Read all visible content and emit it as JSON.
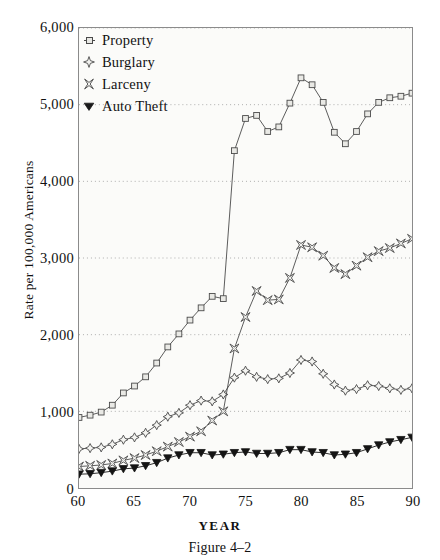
{
  "figure": {
    "caption": "Figure 4–2",
    "xlabel": "YEAR",
    "ylabel": "Rate per 100,000 Americans"
  },
  "axes": {
    "yticks": [
      "0",
      "1,000",
      "2,000",
      "3,000",
      "4,000",
      "5,000",
      "6,000"
    ],
    "xticks": [
      "60",
      "65",
      "70",
      "75",
      "80",
      "85",
      "90"
    ]
  },
  "legend": [
    {
      "label": "Property",
      "marker": "square-marker",
      "color": "#3a3a3a"
    },
    {
      "label": "Burglary",
      "marker": "four-point-star-marker",
      "color": "#3a3a3a"
    },
    {
      "label": "Larceny",
      "marker": "x-star-marker",
      "color": "#3a3a3a"
    },
    {
      "label": "Auto Theft",
      "marker": "filled-triangle-marker",
      "color": "#1a1a1a"
    }
  ],
  "chart_data": {
    "type": "line",
    "title": "",
    "xlabel": "YEAR",
    "ylabel": "Rate per 100,000 Americans",
    "xlim": [
      60,
      90
    ],
    "ylim": [
      0,
      6000
    ],
    "grid": "horizontal-dotted",
    "legend_position": "top-left-inside",
    "x": [
      60,
      61,
      62,
      63,
      64,
      65,
      66,
      67,
      68,
      69,
      70,
      71,
      72,
      73,
      74,
      75,
      76,
      77,
      78,
      79,
      80,
      81,
      82,
      83,
      84,
      85,
      86,
      87,
      88,
      89,
      90
    ],
    "series": [
      {
        "name": "Property",
        "marker": "square",
        "values": [
          920,
          950,
          990,
          1080,
          1240,
          1330,
          1450,
          1630,
          1840,
          2010,
          2190,
          2350,
          2500,
          2470,
          4400,
          4820,
          4860,
          4650,
          4710,
          5020,
          5350,
          5260,
          5030,
          4640,
          4490,
          4650,
          4880,
          5030,
          5090,
          5110,
          5150
        ]
      },
      {
        "name": "Burglary",
        "marker": "four-point-star",
        "values": [
          510,
          520,
          530,
          570,
          630,
          660,
          720,
          820,
          930,
          980,
          1080,
          1140,
          1130,
          1220,
          1440,
          1530,
          1450,
          1420,
          1430,
          1500,
          1670,
          1650,
          1490,
          1350,
          1270,
          1290,
          1340,
          1330,
          1300,
          1280,
          1300
        ]
      },
      {
        "name": "Larceny",
        "marker": "x-star",
        "values": [
          280,
          290,
          300,
          320,
          360,
          390,
          430,
          480,
          540,
          600,
          670,
          740,
          880,
          1000,
          1820,
          2230,
          2570,
          2450,
          2460,
          2740,
          3170,
          3140,
          3030,
          2870,
          2790,
          2900,
          3010,
          3090,
          3130,
          3190,
          3250
        ]
      },
      {
        "name": "Auto Theft",
        "marker": "filled-triangle",
        "values": [
          180,
          185,
          200,
          220,
          250,
          260,
          290,
          330,
          390,
          430,
          460,
          460,
          430,
          440,
          460,
          470,
          450,
          450,
          460,
          500,
          500,
          470,
          460,
          430,
          440,
          460,
          510,
          560,
          600,
          630,
          660
        ]
      }
    ]
  }
}
